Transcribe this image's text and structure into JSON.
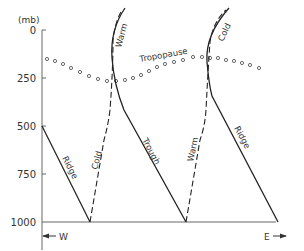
{
  "diagram": {
    "y_axis": {
      "unit": "(mb)",
      "ticks": [
        "0",
        "250",
        "500",
        "750",
        "1000"
      ]
    },
    "x_axis": {
      "west_label": "W",
      "east_label": "E"
    },
    "labels": {
      "tropopause": "Tropopause",
      "ridge_left": "Ridge",
      "cold_left": "Cold",
      "warm_top_left": "Warm",
      "trough": "Trough",
      "warm_right": "Warm",
      "cold_top_right": "Cold",
      "ridge_right": "Ridge"
    },
    "colors": {
      "line": "#222222",
      "axis": "#555555",
      "text": "#333333"
    }
  }
}
